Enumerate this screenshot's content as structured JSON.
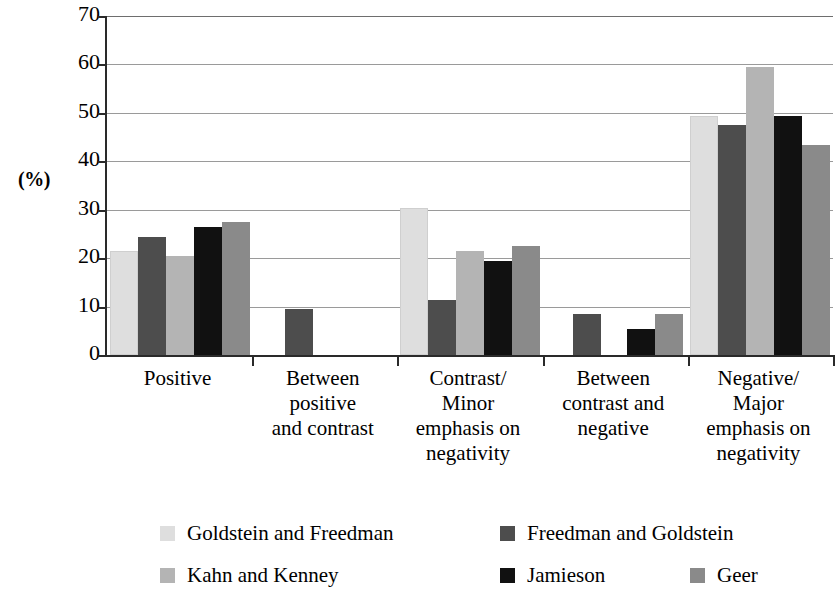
{
  "chart_data": {
    "type": "bar",
    "title": "",
    "subtitle": "",
    "xlabel": "",
    "ylabel": "(%)",
    "ylim": [
      0,
      70
    ],
    "ytick_step": 10,
    "yticks": [
      "70",
      "60",
      "50",
      "40",
      "30",
      "20",
      "10",
      "0"
    ],
    "grid": true,
    "grid_axis": "y",
    "legend_position": "bottom",
    "categories": [
      "Positive",
      "Between positive and contrast",
      "Contrast/ Minor emphasis on negativity",
      "Between contrast and negative",
      "Negative/ Major emphasis on negativity"
    ],
    "category_label_lines": [
      [
        "Positive"
      ],
      [
        "Between",
        "positive",
        "and contrast"
      ],
      [
        "Contrast/",
        "Minor",
        "emphasis on",
        "negativity"
      ],
      [
        "Between",
        "contrast and",
        "negative"
      ],
      [
        "Negative/",
        "Major",
        "emphasis on",
        "negativity"
      ]
    ],
    "series": [
      {
        "name": "Goldstein and Freedman",
        "color": "#dedede",
        "values": [
          21,
          null,
          30,
          null,
          49
        ]
      },
      {
        "name": "Freedman and Goldstein",
        "color": "#4d4d4d",
        "values": [
          24,
          9,
          11,
          8,
          47
        ]
      },
      {
        "name": "Kahn and Kenney",
        "color": "#b4b4b4",
        "values": [
          20,
          null,
          21,
          null,
          59
        ]
      },
      {
        "name": "Jamieson",
        "color": "#111111",
        "values": [
          26,
          null,
          19,
          5,
          49
        ]
      },
      {
        "name": "Geer",
        "color": "#8a8a8a",
        "values": [
          27,
          null,
          22,
          8,
          43
        ]
      }
    ]
  },
  "legend": {
    "rows": [
      [
        {
          "name": "Goldstein and Freedman",
          "color": "#dedede",
          "left": 0
        },
        {
          "name": "Freedman and Goldstein",
          "color": "#4d4d4d",
          "left": 340
        }
      ],
      [
        {
          "name": "Kahn and Kenney",
          "color": "#b4b4b4",
          "left": 0
        },
        {
          "name": "Jamieson",
          "color": "#111111",
          "left": 340
        },
        {
          "name": "Geer",
          "color": "#8a8a8a",
          "left": 530
        }
      ]
    ]
  }
}
